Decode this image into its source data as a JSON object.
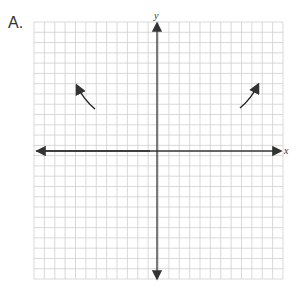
{
  "problem": {
    "label": "A."
  },
  "graph": {
    "x_axis_label": "x",
    "y_axis_label": "y",
    "grid": {
      "columns": 24,
      "rows": 25,
      "color": "#c8c8c8"
    },
    "axis_color": "#333333",
    "end_behavior_arrows": [
      {
        "side": "left",
        "direction": "up-left"
      },
      {
        "side": "right",
        "direction": "up-right"
      }
    ]
  }
}
